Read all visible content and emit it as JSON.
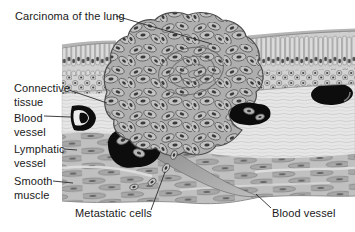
{
  "figure": {
    "type": "medical-histology-illustration",
    "labels": {
      "carcinoma": "Carcinoma of the lung",
      "connective_tissue": "Connective tissue",
      "blood_vessel_left": "Blood vessel",
      "lymphatic_vessel": "Lymphatic vessel",
      "smooth_muscle": "Smooth muscle",
      "metastatic_cells": "Metastatic cells",
      "blood_vessel_bottom": "Blood vessel"
    },
    "palette": {
      "background": "#ffffff",
      "text": "#1a1a1a",
      "leader_line": "#2a2a2a",
      "vessel_black": "#0d0d0d",
      "tumor_fill": "#aeaeae",
      "tumor_cell_fill": "#c3c3c3",
      "tumor_outline": "#4d4d4d",
      "muscle_fill": "#c0c0c0",
      "muscle_spindle": "#a8a8a8",
      "connective_fill": "#e6e6e6",
      "epithelium_fill": "#d8d8d8",
      "nucleus": "#3a3a3a",
      "channel_fill": "#979797"
    }
  }
}
